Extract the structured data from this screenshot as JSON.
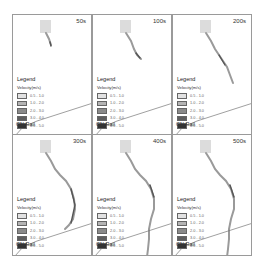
{
  "figure": {
    "panels": [
      {
        "time": "50s",
        "legend_title": "Legend",
        "legend_subtitle": "Velocity(m/s)",
        "rail_label": "CN Rail",
        "flow_extent": "short"
      },
      {
        "time": "100s",
        "legend_title": "Legend",
        "legend_subtitle": "Velocity(m/s)",
        "rail_label": "CN Rail",
        "flow_extent": "medium"
      },
      {
        "time": "200s",
        "legend_title": "Legend",
        "legend_subtitle": "Velocity(m/s)",
        "rail_label": "CN Rail",
        "flow_extent": "long"
      },
      {
        "time": "300s",
        "legend_title": "Legend",
        "legend_subtitle": "Velocity(m/s)",
        "rail_label": "CN Rail",
        "flow_extent": "longer"
      },
      {
        "time": "400s",
        "legend_title": "Legend",
        "legend_subtitle": "Velocity(m/s)",
        "rail_label": "CN Rail",
        "flow_extent": "full"
      },
      {
        "time": "500s",
        "legend_title": "Legend",
        "legend_subtitle": "Velocity(m/s)",
        "rail_label": "CN Rail",
        "flow_extent": "full"
      }
    ],
    "legend_classes": [
      {
        "label": "0.5 - 1.0",
        "color": "#e2e2e2"
      },
      {
        "label": "1.0 - 2.0",
        "color": "#b4b4b4"
      },
      {
        "label": "2.0 - 3.0",
        "color": "#8a8a8a"
      },
      {
        "label": "3.0 - 4.0",
        "color": "#5e5e5e"
      },
      {
        "label": "4.0 - 5.0",
        "color": "#333333"
      }
    ],
    "colors": {
      "border": "#9a9a9a",
      "rail": "#777777",
      "reservoir": "#dcdcdc",
      "flow": "#a0a0a0"
    }
  }
}
